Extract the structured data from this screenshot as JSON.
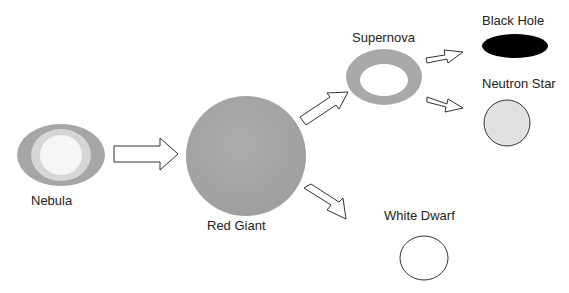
{
  "diagram": {
    "stages": {
      "nebula": {
        "label": "Nebula"
      },
      "red_giant": {
        "label": "Red Giant"
      },
      "supernova": {
        "label": "Supernova"
      },
      "black_hole": {
        "label": "Black Hole"
      },
      "neutron_star": {
        "label": "Neutron Star"
      },
      "white_dwarf": {
        "label": "White Dwarf"
      }
    },
    "edges": [
      {
        "from": "nebula",
        "to": "red_giant"
      },
      {
        "from": "red_giant",
        "to": "supernova"
      },
      {
        "from": "red_giant",
        "to": "white_dwarf"
      },
      {
        "from": "supernova",
        "to": "black_hole"
      },
      {
        "from": "supernova",
        "to": "neutron_star"
      }
    ],
    "colors": {
      "nebula_outer": "#a6a6a6",
      "nebula_mid": "#d6d6d6",
      "nebula_inner": "#f6f6f6",
      "red_giant": "#a4a4a4",
      "supernova_ring": "#a8a8a8",
      "black_hole": "#000000",
      "neutron_star": "#e0e0e0",
      "white_dwarf": "#ffffff",
      "stroke": "#333333"
    }
  }
}
